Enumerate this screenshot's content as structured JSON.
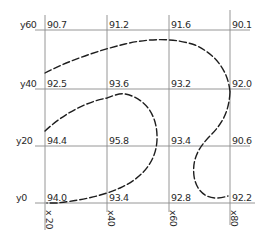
{
  "diagram": {
    "type": "contour-grid",
    "y_axis_labels": [
      "y60",
      "y40",
      "y20",
      "y0"
    ],
    "x_axis_labels": [
      "x 20",
      "x40",
      "x60",
      "x80"
    ],
    "grid_values": {
      "y60": [
        "90.7",
        "91.2",
        "91.6",
        "90.1"
      ],
      "y40": [
        "92.5",
        "93.6",
        "93.2",
        "92.0"
      ],
      "y20": [
        "94.4",
        "95.8",
        "93.4",
        "90.6"
      ],
      "y0": [
        "94.0",
        "93.4",
        "92.8",
        "92.2"
      ]
    },
    "curves": [
      {
        "name": "outer-contour",
        "style": "dashed"
      },
      {
        "name": "inner-contour",
        "style": "dashed"
      },
      {
        "name": "s-contour",
        "style": "dashed"
      }
    ],
    "line_color": "#1e1e1e",
    "grid_color": "#8a8a8a"
  },
  "rows": [
    {
      "label": "y60",
      "values": [
        "90.7",
        "91.2",
        "91.6",
        "90.1"
      ]
    },
    {
      "label": "y40",
      "values": [
        "92.5",
        "93.6",
        "93.2",
        "92.0"
      ]
    },
    {
      "label": "y20",
      "values": [
        "94.4",
        "95.8",
        "93.4",
        "90.6"
      ]
    },
    {
      "label": "y0",
      "values": [
        "94.0",
        "93.4",
        "92.8",
        "92.2"
      ]
    }
  ],
  "columns": [
    "x 20",
    "x40",
    "x60",
    "x80"
  ]
}
